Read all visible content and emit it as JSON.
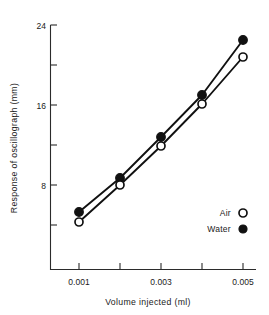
{
  "chart_data": {
    "type": "line",
    "title": "",
    "xlabel": "Volume injected  (ml)",
    "ylabel": "Response of oscillograph  (mm)",
    "x": [
      0.001,
      0.002,
      0.003,
      0.004,
      0.005
    ],
    "xlim": [
      0.0005,
      0.0055
    ],
    "ylim": [
      0,
      24
    ],
    "yticks": [
      8,
      16,
      24
    ],
    "ytick_labels": [
      "8",
      "16",
      "24"
    ],
    "yticks_minor": [
      4,
      12,
      20
    ],
    "xticks": [
      0.001,
      0.002,
      0.003,
      0.004,
      0.005
    ],
    "xtick_labels": [
      "0.001",
      "",
      "0.003",
      "",
      "0.005"
    ],
    "grid": false,
    "legend_position": "lower-right",
    "series": [
      {
        "name": "Air",
        "marker": "open-circle",
        "values": [
          4.3,
          8.0,
          11.9,
          16.1,
          20.8
        ]
      },
      {
        "name": "Water",
        "marker": "filled-circle",
        "values": [
          5.3,
          8.7,
          12.8,
          17.0,
          22.5
        ]
      }
    ]
  },
  "axes": {
    "x_title": "Volume injected  (ml)",
    "y_title": "Response of oscillograph  (mm)",
    "y_labels": [
      "24",
      "16",
      "8"
    ],
    "x_labels": [
      "0.001",
      "0.003",
      "0.005"
    ]
  },
  "legend": {
    "entries": [
      {
        "label": "Air",
        "marker": "open-circle"
      },
      {
        "label": "Water",
        "marker": "filled-circle"
      }
    ]
  },
  "colors": {
    "ink": "#111111",
    "axis": "#2b2b2b",
    "background": "#ffffff"
  }
}
